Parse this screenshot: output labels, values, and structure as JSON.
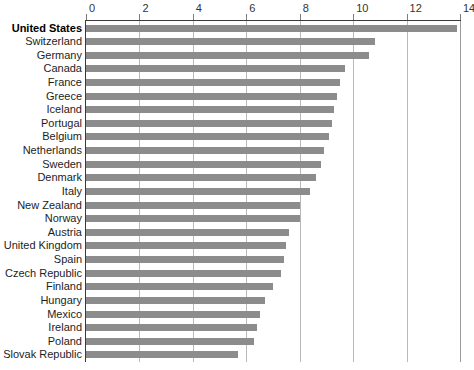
{
  "chart_data": {
    "type": "bar",
    "orientation": "horizontal",
    "title": "",
    "subtitle": "",
    "xlabel": "",
    "ylabel": "",
    "xlim": [
      0,
      14
    ],
    "xticks": [
      0,
      2,
      4,
      6,
      8,
      10,
      12,
      14
    ],
    "xtick_labels": [
      "0",
      "2",
      "4",
      "6",
      "8",
      "10",
      "12",
      "14"
    ],
    "grid": "vertical",
    "legend": "none",
    "bar_color": "#8c8c8c",
    "axis_color": "#3a3a3a",
    "gridline_color": "#b9b9b9",
    "highlight_category": "United States",
    "categories": [
      "United States",
      "Switzerland",
      "Germany",
      "Canada",
      "France",
      "Greece",
      "Iceland",
      "Portugal",
      "Belgium",
      "Netherlands",
      "Sweden",
      "Denmark",
      "Italy",
      "New Zealand",
      "Norway",
      "Austria",
      "United Kingdom",
      "Spain",
      "Czech Republic",
      "Finland",
      "Hungary",
      "Mexico",
      "Ireland",
      "Poland",
      "Slovak Republic"
    ],
    "values": [
      13.9,
      10.8,
      10.6,
      9.7,
      9.5,
      9.4,
      9.3,
      9.2,
      9.1,
      8.9,
      8.8,
      8.6,
      8.4,
      8.0,
      8.0,
      7.6,
      7.5,
      7.4,
      7.3,
      7.0,
      6.7,
      6.5,
      6.4,
      6.3,
      5.7
    ]
  }
}
